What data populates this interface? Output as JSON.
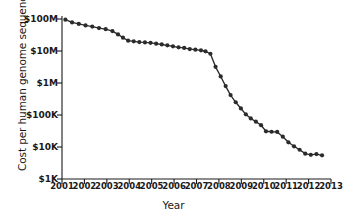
{
  "chart_data": {
    "type": "line",
    "title": "",
    "xlabel": "Year",
    "ylabel": "Cost per human genome sequenced",
    "yscale": "log",
    "ylim": [
      1000,
      100000000
    ],
    "xlim": [
      2001,
      2013
    ],
    "grid": false,
    "legend": null,
    "y_tick_labels": [
      "$100M",
      "$10M",
      "$1M",
      "$100K",
      "$10K",
      "$1K"
    ],
    "y_tick_values": [
      100000000,
      10000000,
      1000000,
      100000,
      10000,
      1000
    ],
    "x_tick_labels": [
      "2001",
      "2002",
      "2003",
      "2004",
      "2005",
      "2006",
      "2007",
      "2008",
      "2009",
      "2010",
      "2011",
      "2012",
      "2013"
    ],
    "x_tick_values": [
      2001,
      2002,
      2003,
      2004,
      2005,
      2006,
      2007,
      2008,
      2009,
      2010,
      2011,
      2012,
      2013
    ],
    "series": [
      {
        "name": "Cost per human genome sequenced",
        "marker": "circle",
        "color": "#2b2b2b",
        "x": [
          2001.15,
          2001.45,
          2001.75,
          2002.05,
          2002.35,
          2002.65,
          2002.95,
          2003.25,
          2003.5,
          2003.72,
          2003.95,
          2004.2,
          2004.45,
          2004.7,
          2004.95,
          2005.2,
          2005.45,
          2005.7,
          2005.95,
          2006.2,
          2006.45,
          2006.7,
          2006.95,
          2007.2,
          2007.4,
          2007.62,
          2007.85,
          2008.08,
          2008.3,
          2008.52,
          2008.75,
          2008.98,
          2009.2,
          2009.42,
          2009.65,
          2009.88,
          2010.1,
          2010.35,
          2010.6,
          2010.85,
          2011.1,
          2011.35,
          2011.6,
          2011.85,
          2012.1,
          2012.35,
          2012.6
        ],
        "y": [
          95000000,
          78000000,
          70000000,
          63000000,
          58000000,
          52000000,
          48000000,
          42000000,
          33000000,
          26000000,
          21000000,
          20000000,
          19000000,
          18500000,
          18000000,
          17000000,
          16000000,
          15000000,
          14000000,
          13000000,
          12500000,
          11500000,
          11000000,
          10500000,
          9800000,
          8200000,
          3200000,
          1600000,
          800000,
          420000,
          250000,
          160000,
          105000,
          78000,
          62000,
          48000,
          31000,
          30000,
          29500,
          21000,
          14000,
          10500,
          8200,
          6200,
          5700,
          6000,
          5500
        ]
      }
    ]
  },
  "axes": {
    "y_title": "Cost per human genome sequenced",
    "x_title": "Year"
  }
}
